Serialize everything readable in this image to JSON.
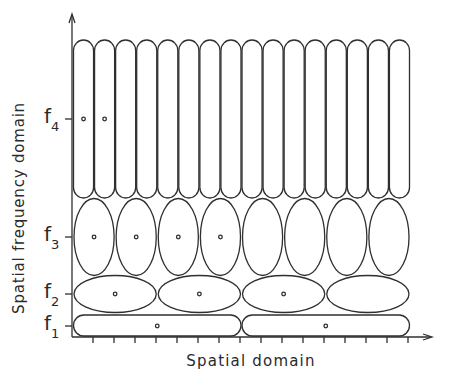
{
  "diagram": {
    "xlabel": "Spatial domain",
    "ylabel": "Spatial frequency domain",
    "colors": {
      "line": "#2f2f2f",
      "background": "#ffffff"
    },
    "axis": {
      "origin": [
        72,
        337
      ],
      "x_end": 432,
      "y_end": 14,
      "x_ticks": [
        93,
        114,
        135,
        156,
        177,
        198,
        219,
        240,
        261,
        282,
        303,
        324,
        345,
        366,
        387,
        408
      ]
    },
    "rows": [
      {
        "label": "f",
        "sub": "4",
        "cy": 119,
        "count": 16,
        "top": 40,
        "bottom": 198,
        "shape": "capsule",
        "dots": [
          0,
          1
        ]
      },
      {
        "label": "f",
        "sub": "3",
        "cy": 237,
        "count": 8,
        "top": 199,
        "bottom": 276,
        "shape": "ellipse",
        "dots": [
          0,
          1,
          2,
          3
        ]
      },
      {
        "label": "f",
        "sub": "2",
        "cy": 294,
        "count": 4,
        "top": 276,
        "bottom": 313,
        "shape": "ellipse",
        "dots": [
          0,
          1,
          2
        ]
      },
      {
        "label": "f",
        "sub": "1",
        "cy": 326,
        "count": 2,
        "top": 315,
        "bottom": 336,
        "shape": "capsule",
        "dots": [
          0,
          1
        ]
      }
    ],
    "grid_x": [
      73,
      410
    ]
  }
}
